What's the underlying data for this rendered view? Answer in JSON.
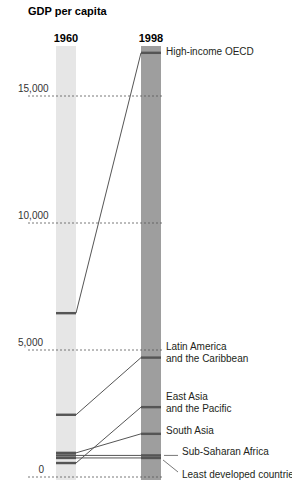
{
  "chart_data": {
    "type": "slope",
    "title": "GDP per capita",
    "xlabel": "",
    "ylabel": "GDP per capita",
    "categories": [
      "1960",
      "1998"
    ],
    "yticks": [
      0,
      5000,
      10000,
      15000
    ],
    "ytick_labels": [
      "0",
      "5,000",
      "10,000",
      "15,000"
    ],
    "ylim": [
      0,
      17000
    ],
    "grid": "dashed horizontal at ticks",
    "series": [
      {
        "name": "High-income OECD",
        "values": [
          6450,
          16700
        ],
        "label_lines": [
          "High-income OECD"
        ]
      },
      {
        "name": "Latin America and the Caribbean",
        "values": [
          2450,
          4700
        ],
        "label_lines": [
          "Latin America",
          "and the Caribbean"
        ]
      },
      {
        "name": "East Asia and the Pacific",
        "values": [
          550,
          2750
        ],
        "label_lines": [
          "East Asia",
          "and the Pacific"
        ]
      },
      {
        "name": "South Asia",
        "values": [
          950,
          1700
        ],
        "label_lines": [
          "South Asia"
        ]
      },
      {
        "name": "Sub-Saharan Africa",
        "values": [
          850,
          850
        ],
        "label_lines": [
          "Sub-Saharan Africa"
        ]
      },
      {
        "name": "Least developed countries",
        "values": [
          750,
          750
        ],
        "label_lines": [
          "Least developed countries"
        ]
      }
    ]
  },
  "colors": {
    "bar_1960": "#e6e6e6",
    "bar_1998": "#9e9e9e",
    "line": "#555555",
    "marker": "#555555",
    "grid": "#555555"
  }
}
